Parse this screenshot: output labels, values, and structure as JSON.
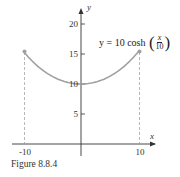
{
  "chart_data": {
    "type": "line",
    "title": "",
    "equation": {
      "lhs": "y = 10 cosh",
      "frac_num": "x",
      "frac_den": "10"
    },
    "xlabel": "x",
    "ylabel": "y",
    "xlim": [
      -12,
      12
    ],
    "ylim": [
      0,
      23
    ],
    "x_ticks": [
      "-10",
      "10"
    ],
    "y_ticks": [
      "5",
      "10",
      "15",
      "20"
    ],
    "series": [
      {
        "name": "y = 10 cosh(x/10)",
        "x": [
          -10,
          -8,
          -6,
          -4,
          -2,
          0,
          2,
          4,
          6,
          8,
          10
        ],
        "values": [
          15.43,
          13.37,
          11.85,
          10.81,
          10.2,
          10.0,
          10.2,
          10.81,
          11.85,
          13.37,
          15.43
        ],
        "color": "#a0a0a0"
      }
    ],
    "endpoints": [
      [
        -10,
        15.43
      ],
      [
        10,
        15.43
      ]
    ],
    "dashed_guides_at_x": [
      -10,
      10
    ],
    "grid": false
  },
  "caption": "Figure 8.8.4",
  "colors": {
    "curve": "#a0a0a0",
    "axis": "#333333",
    "guide": "#999999"
  }
}
